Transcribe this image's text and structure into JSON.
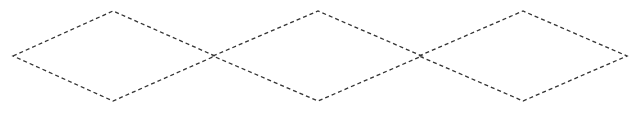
{
  "canvas": {
    "width": 637,
    "height": 115,
    "background": "#ffffff"
  },
  "style": {
    "stroke": "#333333",
    "dash": "4 3"
  },
  "shapes": [
    {
      "type": "diamond",
      "points": "13,56 113,11 215,56 113,101"
    },
    {
      "type": "diamond",
      "points": "213,56 318,11 422,56 318,101"
    },
    {
      "type": "diamond",
      "points": "419,56 523,11 627,56 523,101"
    }
  ]
}
